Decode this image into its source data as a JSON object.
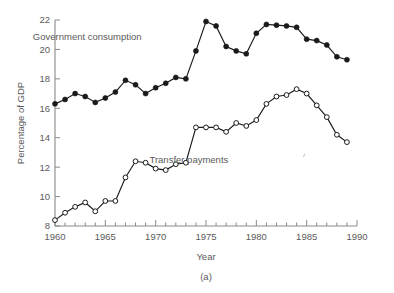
{
  "figure": {
    "caption": "(a)",
    "y_axis_title": "Percentage of GDP",
    "x_axis_title": "Year"
  },
  "chart_data": {
    "type": "line",
    "title": "",
    "xlabel": "Year",
    "ylabel": "Percentage of GDP",
    "xlim": [
      1960,
      1990
    ],
    "ylim": [
      8,
      22
    ],
    "grid": false,
    "legend_position": "inline-annotation",
    "x_major_ticks": [
      1960,
      1965,
      1970,
      1975,
      1980,
      1985,
      1990
    ],
    "x_minor_tick_step": 1,
    "y_major_ticks": [
      8,
      10,
      12,
      14,
      16,
      18,
      20,
      22
    ],
    "x_tick_labels": [
      "1960",
      "1965",
      "1970",
      "1975",
      "1980",
      "1985",
      "1990"
    ],
    "y_tick_labels": [
      "8",
      "10",
      "12",
      "14",
      "16",
      "18",
      "20",
      "22"
    ],
    "x": [
      1960,
      1961,
      1962,
      1963,
      1964,
      1965,
      1966,
      1967,
      1968,
      1969,
      1970,
      1971,
      1972,
      1973,
      1974,
      1975,
      1976,
      1977,
      1978,
      1979,
      1980,
      1981,
      1982,
      1983,
      1984,
      1985,
      1986,
      1987,
      1988,
      1989
    ],
    "series": [
      {
        "name": "Government consumption",
        "marker": "filled-circle",
        "label_x": 1963.2,
        "label_y": 20.9,
        "values": [
          16.3,
          16.6,
          17.0,
          16.8,
          16.4,
          16.7,
          17.1,
          17.9,
          17.6,
          17.0,
          17.4,
          17.7,
          18.1,
          18.0,
          19.9,
          21.9,
          21.6,
          20.2,
          19.9,
          19.7,
          21.1,
          21.7,
          21.65,
          21.6,
          21.5,
          20.7,
          20.6,
          20.3,
          19.5,
          19.3
        ]
      },
      {
        "name": "Transfer payments",
        "marker": "open-circle",
        "label_x": 1973.3,
        "label_y": 12.5,
        "values": [
          8.4,
          8.9,
          9.3,
          9.6,
          9.0,
          9.7,
          9.7,
          11.3,
          12.4,
          12.3,
          11.9,
          11.8,
          12.2,
          12.3,
          14.7,
          14.7,
          14.7,
          14.4,
          15.0,
          14.8,
          15.2,
          16.3,
          16.8,
          16.9,
          17.3,
          17.0,
          16.2,
          15.4,
          14.2,
          13.7
        ]
      }
    ],
    "annotations": [
      {
        "text": "Government consumption",
        "x": 1963.2,
        "y": 20.9
      },
      {
        "text": "Transfer payments",
        "x": 1973.3,
        "y": 12.5
      }
    ]
  }
}
